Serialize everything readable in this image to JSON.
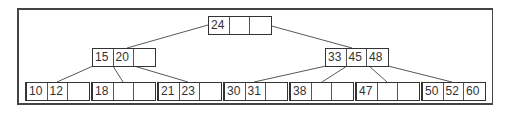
{
  "diagram": {
    "type": "b-tree",
    "order_keys_per_node": 3,
    "root": {
      "keys": [
        "24",
        "",
        ""
      ]
    },
    "internal": [
      {
        "keys": [
          "15",
          "20",
          ""
        ]
      },
      {
        "keys": [
          "33",
          "45",
          "48"
        ]
      }
    ],
    "leaves": [
      {
        "keys": [
          "10",
          "12",
          ""
        ]
      },
      {
        "keys": [
          "18",
          "",
          ""
        ]
      },
      {
        "keys": [
          "21",
          "23",
          ""
        ]
      },
      {
        "keys": [
          "30",
          "31",
          ""
        ]
      },
      {
        "keys": [
          "38",
          "",
          ""
        ]
      },
      {
        "keys": [
          "47",
          "",
          ""
        ]
      },
      {
        "keys": [
          "50",
          "52",
          "60"
        ]
      }
    ],
    "colors": {
      "line": "#333333",
      "frame": "#444444",
      "text": "#333333",
      "background": "#ffffff"
    }
  }
}
